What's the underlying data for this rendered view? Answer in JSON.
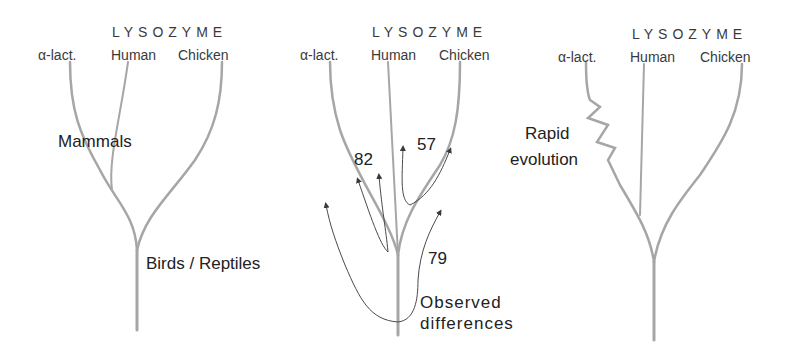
{
  "figure": {
    "colors": {
      "branch": "#a6a6a6",
      "text": "#2a2a2a",
      "arrow": "#4a4a4a",
      "background": "#ffffff"
    },
    "panels": [
      {
        "id": "left",
        "group_label": "LYSOZYME",
        "leaves": [
          "α-lact.",
          "Human",
          "Chicken"
        ],
        "annotations": {
          "mammals": "Mammals",
          "birds_reptiles": "Birds / Reptiles"
        }
      },
      {
        "id": "middle",
        "group_label": "LYSOZYME",
        "leaves": [
          "α-lact.",
          "Human",
          "Chicken"
        ],
        "differences": {
          "alact_human": "82",
          "human_chicken": "57",
          "alact_chicken": "79"
        },
        "annotations": {
          "observed": "Observed",
          "differences": "differences"
        }
      },
      {
        "id": "right",
        "group_label": "LYSOZYME",
        "leaves": [
          "α-lact.",
          "Human",
          "Chicken"
        ],
        "annotations": {
          "rapid": "Rapid",
          "evolution": "evolution"
        }
      }
    ]
  }
}
